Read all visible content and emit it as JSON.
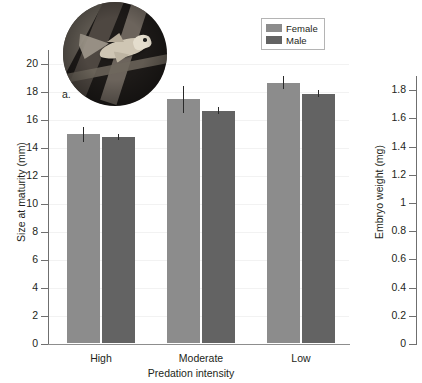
{
  "figure": {
    "panel_label": "a."
  },
  "chart_data": [
    {
      "type": "bar",
      "panel": "a",
      "title": "",
      "xlabel": "Predation intensity",
      "ylabel": "Size at maturity (mm)",
      "categories": [
        "High",
        "Moderate",
        "Low"
      ],
      "ylim": [
        0,
        21
      ],
      "yticks": [
        0,
        2,
        4,
        6,
        8,
        10,
        12,
        14,
        16,
        18,
        20
      ],
      "ytick_labels": [
        "0",
        "2",
        "4",
        "6",
        "8",
        "10",
        "12",
        "14",
        "16",
        "18",
        "20"
      ],
      "grid": true,
      "legend_position": "top-right",
      "series": [
        {
          "name": "Female",
          "color": "#8c8c8c",
          "values": [
            14.9,
            17.4,
            18.6
          ],
          "errors": [
            0.55,
            0.95,
            0.45
          ]
        },
        {
          "name": "Male",
          "color": "#636363",
          "values": [
            14.7,
            16.6,
            17.8
          ],
          "errors": [
            0.2,
            0.25,
            0.25
          ]
        }
      ]
    },
    {
      "type": "bar",
      "panel": "b",
      "title": "",
      "xlabel": "",
      "ylabel": "Embryo weight (mg)",
      "categories": [],
      "ylim": [
        0,
        1.9
      ],
      "yticks": [
        0,
        0.2,
        0.4,
        0.6,
        0.8,
        1.0,
        1.2,
        1.4,
        1.6,
        1.8
      ],
      "ytick_labels": [
        "0",
        "0.2",
        "0.4",
        "0.6",
        "0.8",
        "1",
        "1.2",
        "1.4",
        "1.6",
        "1.8"
      ],
      "grid": false,
      "series": [],
      "note": "panel cropped at right edge of screenshot; only axis visible"
    }
  ],
  "legend": {
    "items": [
      {
        "label": "Female",
        "color": "#8c8c8c"
      },
      {
        "label": "Male",
        "color": "#636363"
      }
    ]
  },
  "inset_photo": {
    "name": "guppy-fish-photo",
    "description": "circular photograph of a fish among dark algae"
  }
}
